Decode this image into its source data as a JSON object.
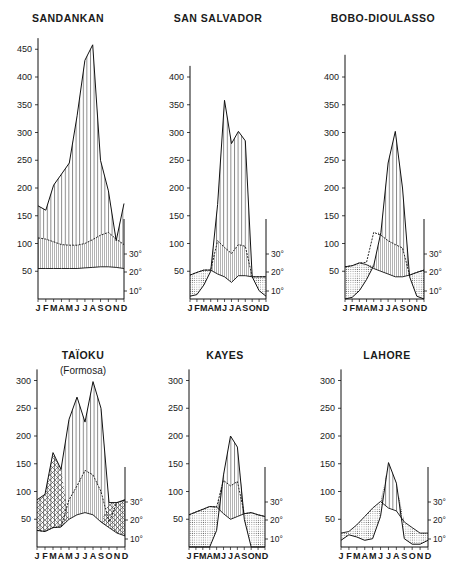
{
  "figure": {
    "month_labels": [
      "J",
      "F",
      "M",
      "A",
      "M",
      "J",
      "J",
      "A",
      "S",
      "O",
      "N",
      "D"
    ],
    "temp_ticks": [
      "10°",
      "20°",
      "30°"
    ]
  },
  "chart_data": [
    {
      "type": "line",
      "title": "SANDANKAN",
      "subtitle": "",
      "xlabel": "",
      "ylabel": "Precipitation (mm)",
      "y_ticks": [
        50,
        100,
        150,
        200,
        250,
        300,
        350,
        400,
        450
      ],
      "ylim": [
        0,
        470
      ],
      "right_axis_ticks": [
        "10°",
        "20°",
        "30°"
      ],
      "categories": [
        "J",
        "F",
        "M",
        "A",
        "M",
        "J",
        "J",
        "A",
        "S",
        "O",
        "N",
        "D"
      ],
      "series": [
        {
          "name": "precipitation_mm",
          "values": [
            168,
            160,
            205,
            225,
            245,
            330,
            430,
            458,
            250,
            195,
            105,
            172
          ]
        },
        {
          "name": "temperature_upper_mm_equiv",
          "values": [
            110,
            108,
            103,
            98,
            97,
            97,
            100,
            107,
            115,
            120,
            108,
            98
          ]
        },
        {
          "name": "temperature_lower_mm_equiv",
          "values": [
            55,
            55,
            55,
            55,
            55,
            55,
            56,
            57,
            58,
            58,
            57,
            55
          ]
        }
      ],
      "fill": "humid"
    },
    {
      "type": "line",
      "title": "SAN SALVADOR",
      "subtitle": "",
      "xlabel": "",
      "ylabel": "Precipitation (mm)",
      "y_ticks": [
        50,
        100,
        150,
        200,
        250,
        300,
        350,
        400
      ],
      "ylim": [
        0,
        420
      ],
      "right_axis_ticks": [
        "10°",
        "20°",
        "30°"
      ],
      "categories": [
        "J",
        "F",
        "M",
        "A",
        "M",
        "J",
        "J",
        "A",
        "S",
        "O",
        "N",
        "D"
      ],
      "series": [
        {
          "name": "precipitation_mm",
          "values": [
            5,
            8,
            25,
            50,
            170,
            358,
            280,
            302,
            285,
            40,
            15,
            5
          ]
        },
        {
          "name": "temperature_mm_equiv",
          "values": [
            43,
            48,
            52,
            52,
            105,
            93,
            82,
            98,
            95,
            40,
            40,
            40
          ]
        },
        {
          "name": "temperature_lower_mm_equiv",
          "values": [
            43,
            48,
            52,
            52,
            45,
            40,
            30,
            42,
            42,
            40,
            40,
            40
          ]
        }
      ],
      "fill": "humid-center, dry-edges"
    },
    {
      "type": "line",
      "title": "BOBO-DIOULASSO",
      "subtitle": "",
      "xlabel": "",
      "ylabel": "Precipitation (mm)",
      "y_ticks": [
        50,
        100,
        150,
        200,
        250,
        300,
        350,
        400
      ],
      "ylim": [
        0,
        440
      ],
      "right_axis_ticks": [
        "10°",
        "20°",
        "30°"
      ],
      "categories": [
        "J",
        "F",
        "M",
        "A",
        "M",
        "J",
        "J",
        "A",
        "S",
        "O",
        "N",
        "D"
      ],
      "series": [
        {
          "name": "precipitation_mm",
          "values": [
            0,
            3,
            15,
            35,
            60,
            120,
            245,
            302,
            200,
            40,
            5,
            0
          ]
        },
        {
          "name": "temperature_mm_equiv",
          "values": [
            58,
            60,
            65,
            66,
            120,
            115,
            105,
            98,
            92,
            43,
            48,
            52
          ]
        },
        {
          "name": "temperature_lower_mm_equiv",
          "values": [
            58,
            60,
            65,
            62,
            55,
            50,
            45,
            40,
            40,
            43,
            48,
            52
          ]
        }
      ],
      "fill": "humid-center, dry-edges"
    },
    {
      "type": "line",
      "title": "TAÏOKU",
      "subtitle": "(Formosa)",
      "xlabel": "",
      "ylabel": "Precipitation (mm)",
      "y_ticks": [
        50,
        100,
        150,
        200,
        250,
        300
      ],
      "ylim": [
        0,
        320
      ],
      "right_axis_ticks": [
        "10°",
        "20°",
        "30°"
      ],
      "categories": [
        "J",
        "F",
        "M",
        "A",
        "M",
        "J",
        "J",
        "A",
        "S",
        "O",
        "N",
        "D"
      ],
      "series": [
        {
          "name": "precipitation_mm",
          "values": [
            85,
            95,
            170,
            140,
            230,
            270,
            225,
            298,
            250,
            80,
            80,
            85
          ]
        },
        {
          "name": "temperature_upper_mm_equiv",
          "values": [
            30,
            28,
            35,
            36,
            85,
            110,
            138,
            130,
            100,
            45,
            80,
            85
          ]
        },
        {
          "name": "temperature_lower_mm_equiv",
          "values": [
            30,
            28,
            35,
            36,
            50,
            58,
            62,
            58,
            45,
            35,
            25,
            20
          ]
        }
      ],
      "fill": "crosshatch-spring-winter, humid-summer"
    },
    {
      "type": "line",
      "title": "KAYES",
      "subtitle": "",
      "xlabel": "",
      "ylabel": "Precipitation (mm)",
      "y_ticks": [
        50,
        100,
        150,
        200,
        250,
        300
      ],
      "ylim": [
        0,
        320
      ],
      "right_axis_ticks": [
        "10°",
        "20°",
        "30°"
      ],
      "categories": [
        "J",
        "F",
        "M",
        "A",
        "M",
        "J",
        "J",
        "A",
        "S",
        "O",
        "N",
        "D"
      ],
      "series": [
        {
          "name": "precipitation_mm",
          "values": [
            0,
            0,
            0,
            0,
            30,
            130,
            200,
            180,
            50,
            0,
            0,
            0
          ]
        },
        {
          "name": "temperature_mm_equiv",
          "values": [
            58,
            63,
            68,
            73,
            72,
            120,
            110,
            118,
            60,
            62,
            58,
            55
          ]
        },
        {
          "name": "temperature_lower_mm_equiv",
          "values": [
            58,
            63,
            68,
            73,
            72,
            60,
            50,
            55,
            60,
            62,
            58,
            55
          ]
        }
      ],
      "fill": "humid-center, dry-edges"
    },
    {
      "type": "line",
      "title": "LAHORE",
      "subtitle": "",
      "xlabel": "",
      "ylabel": "Precipitation (mm)",
      "y_ticks": [
        50,
        100,
        150,
        200,
        250,
        300
      ],
      "ylim": [
        0,
        320
      ],
      "right_axis_ticks": [
        "10°",
        "20°",
        "30°"
      ],
      "categories": [
        "J",
        "F",
        "M",
        "A",
        "M",
        "J",
        "J",
        "A",
        "S",
        "O",
        "N",
        "D"
      ],
      "series": [
        {
          "name": "precipitation_mm",
          "values": [
            12,
            22,
            18,
            12,
            15,
            55,
            152,
            115,
            15,
            5,
            5,
            12
          ]
        },
        {
          "name": "temperature_mm_equiv",
          "values": [
            25,
            28,
            40,
            55,
            70,
            82,
            70,
            65,
            45,
            35,
            25,
            25
          ]
        }
      ],
      "fill": "dry-mostly, humid-summer"
    }
  ]
}
